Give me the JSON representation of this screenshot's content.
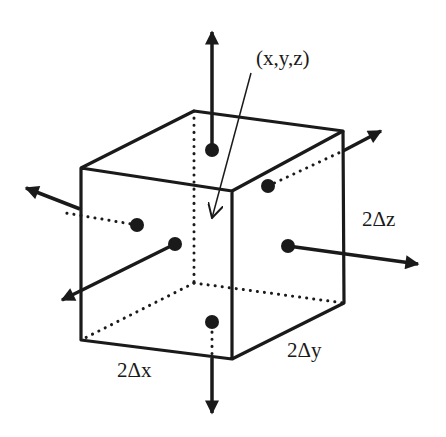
{
  "diagram": {
    "labels": {
      "point": "(x,y,z)",
      "dz": "2Δz",
      "dy": "2Δy",
      "dx": "2Δx"
    },
    "colors": {
      "stroke": "#1a1a1a",
      "background": "#ffffff"
    },
    "elements": {
      "face_dots": 6,
      "normal_arrows": 6,
      "hidden_edges_style": "dotted"
    }
  }
}
